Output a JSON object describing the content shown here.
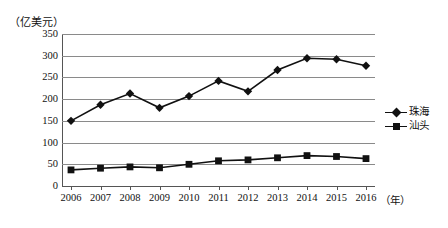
{
  "chart_data": {
    "type": "line",
    "title": "",
    "unit_label": "（亿美元）",
    "xlabel": "（年）",
    "ylabel": "",
    "categories": [
      "2006",
      "2007",
      "2008",
      "2009",
      "2010",
      "2011",
      "2012",
      "2013",
      "2014",
      "2015",
      "2016"
    ],
    "ylim": [
      0,
      350
    ],
    "yticks": [
      0,
      50,
      100,
      150,
      200,
      250,
      300,
      350
    ],
    "ytick_labels": [
      "0",
      "50",
      "100",
      "150",
      "200",
      "250",
      "300",
      "350"
    ],
    "grid": true,
    "legend_position": "right",
    "series": [
      {
        "name": "珠海",
        "marker": "diamond",
        "color": "#111111",
        "values": [
          150,
          187,
          213,
          180,
          207,
          242,
          218,
          267,
          294,
          292,
          277
        ]
      },
      {
        "name": "汕头",
        "marker": "square",
        "color": "#111111",
        "values": [
          37,
          41,
          44,
          42,
          50,
          58,
          60,
          65,
          70,
          68,
          63
        ]
      }
    ]
  },
  "legend": {
    "items": [
      {
        "label": "珠海",
        "marker": "diamond-marker"
      },
      {
        "label": "汕头",
        "marker": "square-marker"
      }
    ]
  }
}
